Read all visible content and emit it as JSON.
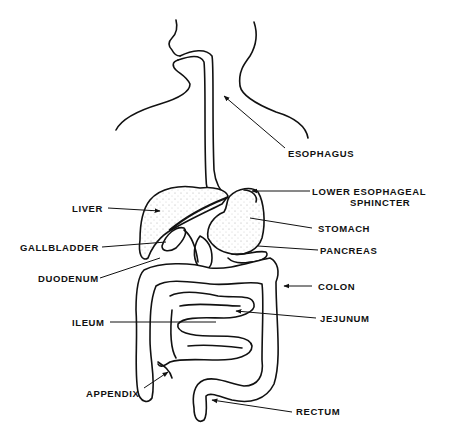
{
  "diagram": {
    "colors": {
      "line": "#111111",
      "background": "#ffffff",
      "stipple": "#444444"
    },
    "labels": {
      "esophagus": "ESOPHAGUS",
      "les_line1": "LOWER  ESOPHAGEAL",
      "les_line2": "SPHINCTER",
      "liver": "LIVER",
      "stomach": "STOMACH",
      "gallbladder": "GALLBLADDER",
      "pancreas": "PANCREAS",
      "duodenum": "DUODENUM",
      "colon": "COLON",
      "ileum": "ILEUM",
      "jejunum": "JEJUNUM",
      "appendix": "APPENDIX",
      "rectum": "RECTUM"
    }
  }
}
